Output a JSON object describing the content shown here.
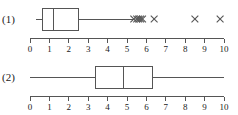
{
  "figure": {
    "width": 238,
    "height": 115,
    "background": "#ffffff",
    "line_color": "#555555",
    "text_color": "#1a1a1a"
  },
  "axis": {
    "min": 0,
    "max": 10,
    "tick_step": 1,
    "tick_labels": [
      "0",
      "1",
      "2",
      "3",
      "4",
      "5",
      "6",
      "7",
      "8",
      "9",
      "10"
    ],
    "px_at_min": 30,
    "px_at_max": 224
  },
  "panels": [
    {
      "id": "panel-1",
      "label": "(1)"
    },
    {
      "id": "panel-2",
      "label": "(2)"
    }
  ],
  "chart_data": {
    "type": "boxplot",
    "title": "",
    "xlabel": "",
    "ylabel": "",
    "xlim": [
      0,
      10
    ],
    "grid": false,
    "legend": "none",
    "orientation": "horizontal",
    "tick_labels": [
      "0",
      "1",
      "2",
      "3",
      "4",
      "5",
      "6",
      "7",
      "8",
      "9",
      "10"
    ],
    "series": [
      {
        "name": "(1)",
        "whisker_low": 0.3,
        "q1": 0.65,
        "median": 1.2,
        "q3": 2.5,
        "whisker_high": 5.3,
        "outliers": [
          5.35,
          5.5,
          5.6,
          5.7,
          5.8,
          6.4,
          8.5,
          9.8
        ],
        "outlier_marker": "x"
      },
      {
        "name": "(2)",
        "whisker_low": 0.0,
        "q1": 3.4,
        "median": 4.8,
        "q3": 6.3,
        "whisker_high": 10.0,
        "outliers": [],
        "outlier_marker": "x"
      }
    ]
  }
}
